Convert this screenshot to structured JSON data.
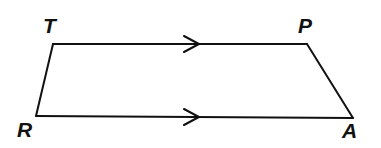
{
  "figure": {
    "kind": "plane-geometry-diagram",
    "shape_name": "trapezoid",
    "shape_label": "TPAR",
    "background_color": "#ffffff",
    "stroke_color": "#111111",
    "canvas": {
      "width": 381,
      "height": 148
    },
    "vertices": [
      {
        "id": "T",
        "label": "T",
        "x": 53,
        "y": 44,
        "label_x": 43,
        "label_y": 15
      },
      {
        "id": "P",
        "label": "P",
        "x": 307,
        "y": 44,
        "label_x": 298,
        "label_y": 15
      },
      {
        "id": "A",
        "label": "A",
        "x": 353,
        "y": 118,
        "label_x": 342,
        "label_y": 120
      },
      {
        "id": "R",
        "label": "R",
        "x": 36,
        "y": 116,
        "label_x": 17,
        "label_y": 119
      }
    ],
    "edges": [
      {
        "id": "TP",
        "from": "T",
        "to": "P",
        "label": "T to P",
        "parallel_marks": 1
      },
      {
        "id": "PA",
        "from": "P",
        "to": "A",
        "label": "P to A",
        "parallel_marks": 0
      },
      {
        "id": "RA",
        "from": "R",
        "to": "A",
        "label": "R to A",
        "parallel_marks": 1
      },
      {
        "id": "TR",
        "from": "T",
        "to": "R",
        "label": "T to R",
        "parallel_marks": 0
      }
    ],
    "parallel_marks": [
      {
        "id": "mark-top",
        "on_edge": "TP",
        "glyph": "single-chevron",
        "x": 191,
        "y": 44
      },
      {
        "id": "mark-bottom",
        "on_edge": "RA",
        "glyph": "single-chevron",
        "x": 191,
        "y": 117
      }
    ]
  }
}
